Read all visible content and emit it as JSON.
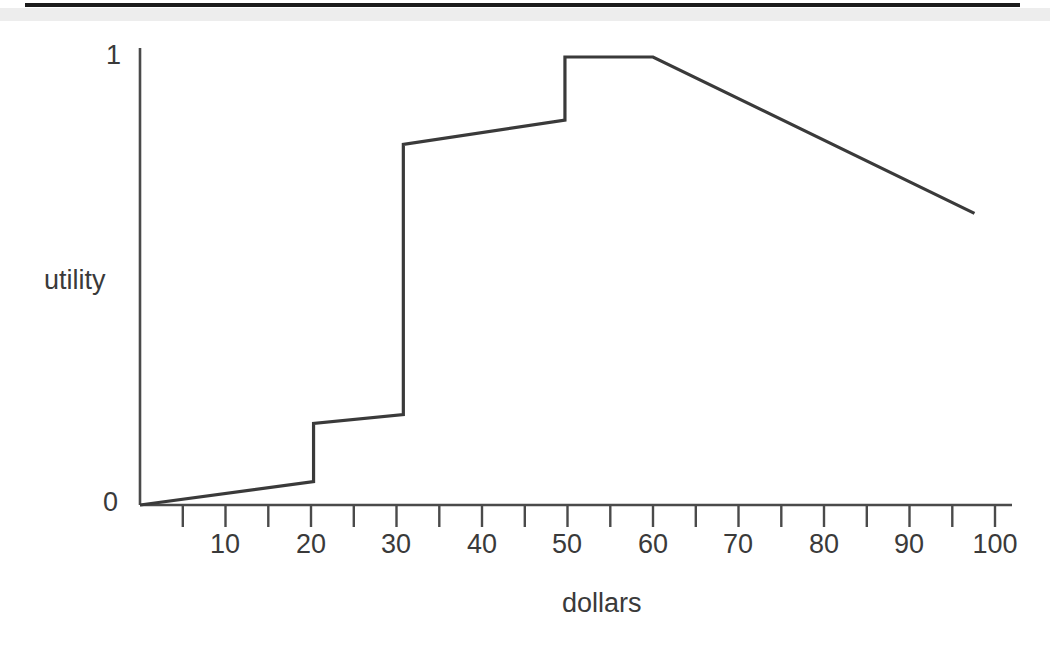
{
  "figure": {
    "name": "utility-vs-dollars-figure",
    "line_color": "#3a3a3a",
    "axis_color": "#4a4a4a",
    "background": "#ffffff",
    "scan_band_color": "#ededed",
    "scan_rule_color": "#1b1b1b"
  },
  "chart_data": {
    "type": "line",
    "title": "",
    "subtitle": "",
    "xlabel": "dollars",
    "ylabel": "utility",
    "xlim": [
      0,
      100
    ],
    "ylim": [
      0,
      1
    ],
    "grid": false,
    "legend": null,
    "x_ticks_major": [
      10,
      20,
      30,
      40,
      50,
      60,
      70,
      80,
      90,
      100
    ],
    "x_ticks_minor": [
      5,
      15,
      25,
      35,
      45,
      55,
      65,
      75,
      85,
      95
    ],
    "x_tick_labels": [
      "10",
      "20",
      "30",
      "40",
      "50",
      "60",
      "70",
      "80",
      "90",
      "100"
    ],
    "y_ticks": [
      0,
      1
    ],
    "y_tick_labels": [
      "0",
      "1"
    ],
    "annotations": [],
    "series": [
      {
        "name": "utility",
        "style": "piecewise-linear-with-jumps",
        "x": [
          0,
          20.3,
          20.3,
          30.8,
          30.8,
          49.7,
          49.7,
          60.0,
          97.6
        ],
        "y": [
          0.0,
          0.052,
          0.182,
          0.202,
          0.805,
          0.859,
          1.0,
          1.0,
          0.651
        ]
      }
    ],
    "jump_points": [
      {
        "x": 20.3,
        "y_from": 0.052,
        "y_to": 0.182
      },
      {
        "x": 30.8,
        "y_from": 0.202,
        "y_to": 0.805
      },
      {
        "x": 49.7,
        "y_from": 0.859,
        "y_to": 1.0
      }
    ]
  }
}
